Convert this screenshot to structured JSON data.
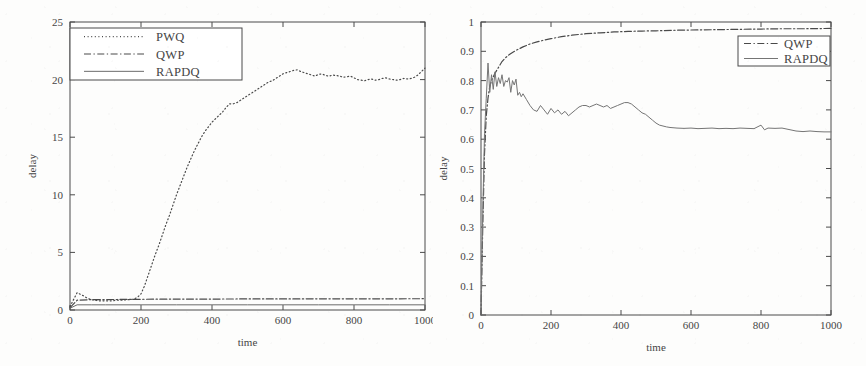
{
  "figure": {
    "background": "#fdfdfc",
    "ink": "#4a4a4a",
    "panel_count": 2
  },
  "chart_data": [
    {
      "id": "left",
      "type": "line",
      "title": "",
      "xlabel": "time",
      "ylabel": "delay",
      "xlim": [
        0,
        1000
      ],
      "ylim": [
        0,
        25
      ],
      "xticks": [
        0,
        200,
        400,
        600,
        800,
        1000
      ],
      "yticks": [
        0,
        5,
        10,
        15,
        20,
        25
      ],
      "xtick_labels": [
        "0",
        "200",
        "400",
        "600",
        "800",
        "1000"
      ],
      "ytick_labels": [
        "0",
        "5",
        "10",
        "15",
        "20",
        "25"
      ],
      "grid": false,
      "legend_position": "upper-left",
      "legend_entries": [
        "PWQ",
        "QWP",
        "RAPDQ"
      ],
      "series": [
        {
          "name": "PWQ",
          "style": "dotted",
          "color": "#4a4a4a",
          "x": [
            0,
            10,
            20,
            30,
            40,
            50,
            60,
            70,
            80,
            90,
            100,
            110,
            120,
            130,
            140,
            150,
            160,
            170,
            180,
            190,
            200,
            210,
            220,
            230,
            240,
            250,
            260,
            270,
            280,
            290,
            300,
            310,
            320,
            330,
            340,
            350,
            360,
            370,
            380,
            390,
            400,
            410,
            420,
            430,
            440,
            450,
            460,
            470,
            480,
            490,
            500,
            510,
            520,
            530,
            540,
            550,
            560,
            570,
            580,
            590,
            600,
            610,
            620,
            630,
            640,
            650,
            660,
            670,
            680,
            690,
            700,
            710,
            720,
            730,
            740,
            750,
            760,
            770,
            780,
            790,
            800,
            810,
            820,
            830,
            840,
            850,
            860,
            870,
            880,
            890,
            900,
            910,
            920,
            930,
            940,
            950,
            960,
            970,
            980,
            990,
            1000
          ],
          "y": [
            0.3,
            0.9,
            1.5,
            1.35,
            1.2,
            1.0,
            0.9,
            0.85,
            0.8,
            0.8,
            0.8,
            0.8,
            0.8,
            0.85,
            0.85,
            0.85,
            0.9,
            0.9,
            0.95,
            1.1,
            1.4,
            2.1,
            3.0,
            3.9,
            4.8,
            5.6,
            6.5,
            7.4,
            8.2,
            9.1,
            10.0,
            10.8,
            11.6,
            12.4,
            13.1,
            13.8,
            14.4,
            15.0,
            15.5,
            15.9,
            16.3,
            16.6,
            16.9,
            17.2,
            17.6,
            17.9,
            17.9,
            18.0,
            18.2,
            18.4,
            18.6,
            18.8,
            19.0,
            19.2,
            19.4,
            19.6,
            19.8,
            19.9,
            20.1,
            20.3,
            20.5,
            20.6,
            20.7,
            20.8,
            20.85,
            20.7,
            20.6,
            20.5,
            20.4,
            20.3,
            20.45,
            20.5,
            20.35,
            20.3,
            20.4,
            20.35,
            20.3,
            20.2,
            20.25,
            20.3,
            20.15,
            20.0,
            19.95,
            19.9,
            20.0,
            20.05,
            19.95,
            20.0,
            20.1,
            20.15,
            20.05,
            20.0,
            19.95,
            20.0,
            20.1,
            20.05,
            20.1,
            20.2,
            20.4,
            20.7,
            21.0
          ]
        },
        {
          "name": "QWP",
          "style": "dashdot",
          "color": "#4a4a4a",
          "x": [
            0,
            20,
            60,
            100,
            150,
            200,
            300,
            400,
            500,
            600,
            700,
            800,
            900,
            1000
          ],
          "y": [
            0.2,
            0.85,
            0.9,
            0.9,
            0.92,
            0.93,
            0.95,
            0.95,
            0.96,
            0.96,
            0.97,
            0.97,
            0.97,
            0.98
          ]
        },
        {
          "name": "RAPDQ",
          "style": "solid",
          "color": "#6b6b6b",
          "x": [
            0,
            20,
            60,
            100,
            200,
            300,
            400,
            500,
            600,
            700,
            800,
            900,
            1000
          ],
          "y": [
            0.15,
            0.45,
            0.45,
            0.45,
            0.45,
            0.45,
            0.45,
            0.45,
            0.45,
            0.45,
            0.45,
            0.45,
            0.45
          ]
        }
      ]
    },
    {
      "id": "right",
      "type": "line",
      "title": "",
      "xlabel": "time",
      "ylabel": "delay",
      "xlim": [
        0,
        1000
      ],
      "ylim": [
        0,
        1
      ],
      "xticks": [
        0,
        200,
        400,
        600,
        800,
        1000
      ],
      "yticks": [
        0,
        0.1,
        0.2,
        0.3,
        0.4,
        0.5,
        0.6,
        0.7,
        0.8,
        0.9,
        1
      ],
      "xtick_labels": [
        "0",
        "200",
        "400",
        "600",
        "800",
        "1000"
      ],
      "ytick_labels": [
        "0",
        "0.1",
        "0.2",
        "0.3",
        "0.4",
        "0.5",
        "0.6",
        "0.7",
        "0.8",
        "0.9",
        "1"
      ],
      "grid": false,
      "legend_position": "upper-right",
      "legend_entries": [
        "QWP",
        "RAPDQ"
      ],
      "series": [
        {
          "name": "QWP",
          "style": "dashdot",
          "color": "#4a4a4a",
          "x": [
            0,
            5,
            10,
            15,
            20,
            25,
            30,
            40,
            50,
            60,
            70,
            80,
            90,
            100,
            120,
            140,
            160,
            180,
            200,
            230,
            260,
            300,
            340,
            380,
            420,
            460,
            500,
            560,
            620,
            680,
            740,
            800,
            860,
            920,
            1000
          ],
          "y": [
            0.0,
            0.3,
            0.55,
            0.68,
            0.74,
            0.78,
            0.8,
            0.825,
            0.845,
            0.865,
            0.878,
            0.888,
            0.896,
            0.903,
            0.915,
            0.925,
            0.932,
            0.938,
            0.943,
            0.95,
            0.955,
            0.96,
            0.963,
            0.966,
            0.968,
            0.969,
            0.97,
            0.972,
            0.973,
            0.974,
            0.975,
            0.976,
            0.977,
            0.977,
            0.978
          ]
        },
        {
          "name": "RAPDQ",
          "style": "solid",
          "color": "#757575",
          "x": [
            0,
            5,
            10,
            15,
            20,
            25,
            30,
            35,
            40,
            45,
            50,
            55,
            60,
            65,
            70,
            75,
            80,
            85,
            90,
            95,
            100,
            105,
            110,
            115,
            120,
            130,
            140,
            150,
            160,
            170,
            180,
            190,
            200,
            210,
            220,
            230,
            240,
            250,
            260,
            270,
            280,
            290,
            300,
            310,
            320,
            330,
            340,
            350,
            360,
            370,
            380,
            390,
            400,
            410,
            420,
            430,
            440,
            450,
            460,
            470,
            480,
            490,
            500,
            510,
            520,
            530,
            540,
            560,
            580,
            600,
            620,
            640,
            660,
            680,
            700,
            720,
            740,
            760,
            780,
            800,
            810,
            820,
            840,
            860,
            880,
            900,
            920,
            940,
            960,
            980,
            1000
          ],
          "y": [
            0.0,
            0.35,
            0.62,
            0.74,
            0.86,
            0.76,
            0.82,
            0.77,
            0.83,
            0.78,
            0.81,
            0.79,
            0.82,
            0.78,
            0.8,
            0.795,
            0.81,
            0.76,
            0.8,
            0.785,
            0.805,
            0.75,
            0.76,
            0.745,
            0.755,
            0.735,
            0.715,
            0.7,
            0.695,
            0.715,
            0.7,
            0.685,
            0.705,
            0.69,
            0.7,
            0.685,
            0.695,
            0.68,
            0.69,
            0.7,
            0.71,
            0.715,
            0.715,
            0.71,
            0.715,
            0.72,
            0.715,
            0.71,
            0.715,
            0.705,
            0.71,
            0.715,
            0.72,
            0.725,
            0.725,
            0.72,
            0.71,
            0.7,
            0.69,
            0.685,
            0.675,
            0.665,
            0.655,
            0.648,
            0.645,
            0.642,
            0.64,
            0.638,
            0.637,
            0.638,
            0.636,
            0.637,
            0.638,
            0.636,
            0.637,
            0.636,
            0.638,
            0.637,
            0.636,
            0.648,
            0.632,
            0.638,
            0.637,
            0.638,
            0.633,
            0.628,
            0.626,
            0.628,
            0.626,
            0.625,
            0.625
          ]
        }
      ]
    }
  ]
}
